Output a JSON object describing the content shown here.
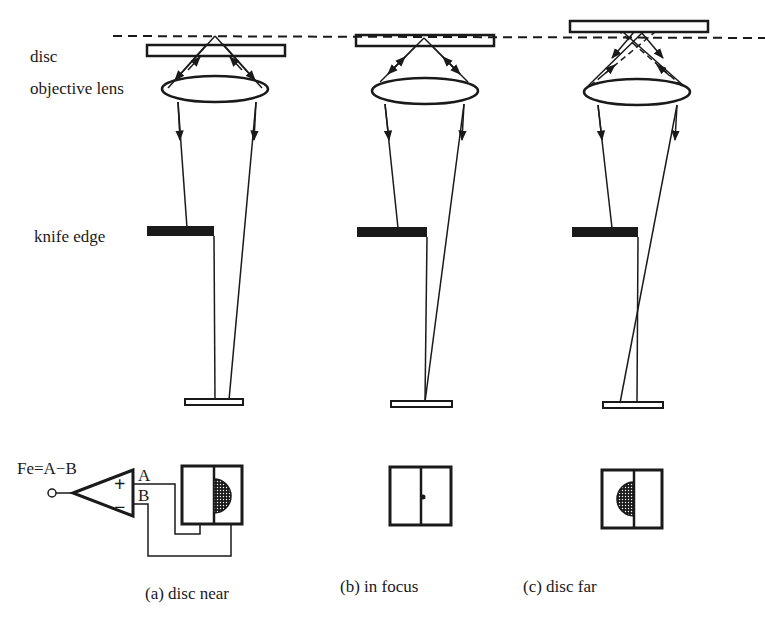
{
  "diagram": {
    "row_labels": {
      "disc": "disc",
      "objective_lens": "objective lens",
      "knife_edge": "knife edge"
    },
    "formula": "Fe=A−B",
    "amplifier": {
      "plus": "+",
      "minus": "−",
      "input_a": "A",
      "input_b": "B"
    },
    "panels": [
      {
        "id": "a",
        "caption": "(a) disc near",
        "disc_position": "below focal plane",
        "spot_side": "right"
      },
      {
        "id": "b",
        "caption": "(b) in focus",
        "disc_position": "on focal plane",
        "spot_side": "center"
      },
      {
        "id": "c",
        "caption": "(c) disc far",
        "disc_position": "above focal plane",
        "spot_side": "left"
      }
    ],
    "colors": {
      "ink": "#1a1a1a",
      "background": "#ffffff"
    }
  }
}
